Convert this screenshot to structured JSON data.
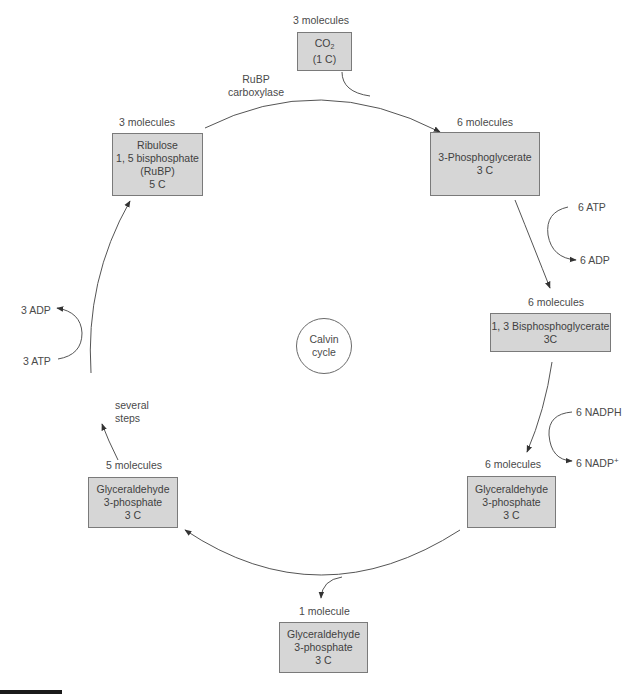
{
  "diagram": {
    "center": {
      "line1": "Calvin",
      "line2": "cycle"
    },
    "nodes": {
      "co2": {
        "count": "3 molecules",
        "line1": "CO",
        "sub": "2",
        "line2": "(1 C)"
      },
      "rubp": {
        "count": "3 molecules",
        "line1": "Ribulose",
        "line2": "1, 5 bisphosphate",
        "line3": "(RuBP)",
        "line4": "5 C"
      },
      "pga": {
        "count": "6 molecules",
        "line1": "3-Phosphoglycerate",
        "line2": "3 C"
      },
      "bpg": {
        "count": "6 molecules",
        "line1": "1, 3 Bisphosphoglycerate",
        "line2": "3C"
      },
      "g3p_right": {
        "count": "6 molecules",
        "line1": "Glyceraldehyde",
        "line2": "3-phosphate",
        "line3": "3 C"
      },
      "g3p_left": {
        "count": "5 molecules",
        "line1": "Glyceraldehyde",
        "line2": "3-phosphate",
        "line3": "3 C"
      },
      "g3p_out": {
        "count": "1 molecule",
        "line1": "Glyceraldehyde",
        "line2": "3-phosphate",
        "line3": "3 C"
      }
    },
    "labels": {
      "enzyme_line1": "RuBP",
      "enzyme_line2": "carboxylase",
      "atp_in_right": "6 ATP",
      "adp_out_right": "6 ADP",
      "nadph_in": "6 NADPH",
      "nadp_out": "6 NADP",
      "nadp_sup": "+",
      "atp_in_left": "3 ATP",
      "adp_out_left": "3 ADP",
      "steps_line1": "several",
      "steps_line2": "steps"
    },
    "colors": {
      "box_fill": "#d6d6d6",
      "box_border": "#7a7a7a",
      "line": "#555555"
    }
  }
}
